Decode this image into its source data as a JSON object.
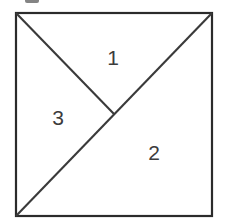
{
  "figure": {
    "type": "geometry-diagram",
    "canvas": {
      "width": 227,
      "height": 224,
      "background": "#ffffff"
    },
    "square": {
      "name": "outer-square",
      "top_left": {
        "x": 16,
        "y": 13
      },
      "top_right": {
        "x": 212,
        "y": 13
      },
      "bottom_right": {
        "x": 212,
        "y": 216
      },
      "bottom_left": {
        "x": 16,
        "y": 216
      },
      "stroke_color": "#2b2b2b",
      "stroke_width": 2.2,
      "fill": "#ffffff"
    },
    "lines": [
      {
        "name": "main-diagonal",
        "from": {
          "x": 16,
          "y": 216
        },
        "to": {
          "x": 212,
          "y": 13
        },
        "stroke_color": "#3a3a3a",
        "stroke_width": 2.1
      },
      {
        "name": "half-diagonal",
        "from": {
          "x": 16,
          "y": 13
        },
        "to": {
          "x": 114,
          "y": 114
        },
        "stroke_color": "#3a3a3a",
        "stroke_width": 2.1
      }
    ],
    "intersection_point": {
      "x": 114,
      "y": 114,
      "name": "center-point"
    },
    "regions": [
      {
        "id": "region-1",
        "label": "1",
        "label_x": 113,
        "label_y": 57,
        "vertices": "16,13 212,13 114,114",
        "text_color": "#3c3c3c"
      },
      {
        "id": "region-2",
        "label": "2",
        "label_x": 154,
        "label_y": 152,
        "vertices": "16,216 212,13 212,216",
        "text_color": "#3c3c3c"
      },
      {
        "id": "region-3",
        "label": "3",
        "label_x": 58,
        "label_y": 117,
        "vertices": "16,13 114,114 16,216",
        "text_color": "#3c3c3c"
      }
    ],
    "label_font_size": 21
  }
}
